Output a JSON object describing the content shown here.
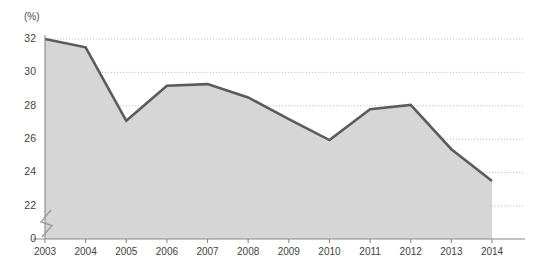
{
  "chart_data": {
    "type": "area",
    "title": "",
    "subtitle": "",
    "xlabel": "",
    "ylabel": "",
    "unit_label": "(%)",
    "categories": [
      "2003",
      "2004",
      "2005",
      "2006",
      "2007",
      "2008",
      "2009",
      "2010",
      "2011",
      "2012",
      "2013",
      "2014"
    ],
    "values": [
      32.0,
      31.5,
      27.1,
      29.2,
      29.3,
      28.5,
      27.2,
      25.95,
      27.8,
      28.05,
      25.4,
      23.5
    ],
    "series": [
      {
        "name": "",
        "values": [
          32.0,
          31.5,
          27.1,
          29.2,
          29.3,
          28.5,
          27.2,
          25.95,
          27.8,
          28.05,
          25.4,
          23.5
        ]
      }
    ],
    "ylim": [
      22,
      32
    ],
    "yticks": [
      22,
      24,
      26,
      28,
      30,
      32
    ],
    "ytick_labels": [
      "22",
      "24",
      "26",
      "28",
      "30",
      "32"
    ],
    "baseline_tick_label": "0",
    "axis_break": true,
    "grid": true,
    "grid_axis": "y",
    "legend": "none",
    "annotations": [],
    "colors": {
      "line": "#5b5b5b",
      "fill": "#d6d6d6",
      "grid": "#b9b9b9",
      "axis": "#8a8a8a",
      "text": "#3f3f3f",
      "background": "#ffffff"
    }
  }
}
